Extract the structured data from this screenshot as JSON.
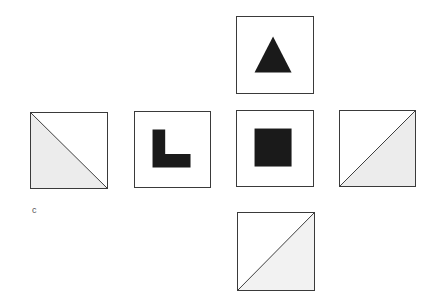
{
  "diagram": {
    "type": "cube-net",
    "label": "c",
    "colors": {
      "border": "#3a3a3a",
      "solid": "#1a1a1a",
      "shade": "#ececec",
      "background": "#ffffff"
    },
    "faces": [
      {
        "id": "top",
        "symbol": "triangle"
      },
      {
        "id": "left",
        "symbol": "diagonal-shaded-lower-left"
      },
      {
        "id": "middle-left",
        "symbol": "L-shape"
      },
      {
        "id": "center",
        "symbol": "square"
      },
      {
        "id": "right",
        "symbol": "diagonal-shaded-lower-right"
      },
      {
        "id": "bottom",
        "symbol": "diagonal-shaded-lower-right"
      }
    ]
  }
}
